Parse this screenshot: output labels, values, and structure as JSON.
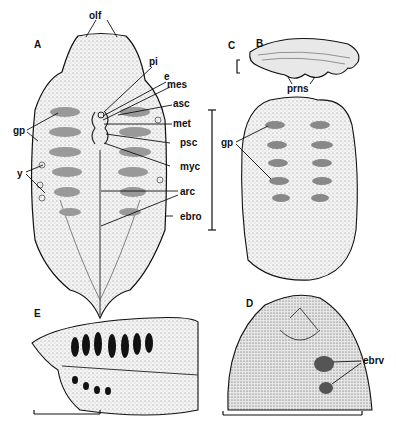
{
  "figure": {
    "panels": {
      "A": "A",
      "B": "B",
      "C": "C",
      "D": "D",
      "E": "E"
    },
    "labels": {
      "olf": "olf",
      "pi": "pi",
      "e": "e",
      "mes": "mes",
      "asc": "asc",
      "met": "met",
      "psc": "psc",
      "myc": "myc",
      "arc": "arc",
      "ebro": "ebro",
      "gp_A": "gp",
      "y": "y",
      "gp_B": "gp",
      "prns": "prns",
      "ebrv": "ebrv"
    },
    "colors": {
      "ink": "#111111",
      "stipple": "#8a8a8a",
      "background": "#ffffff"
    }
  }
}
